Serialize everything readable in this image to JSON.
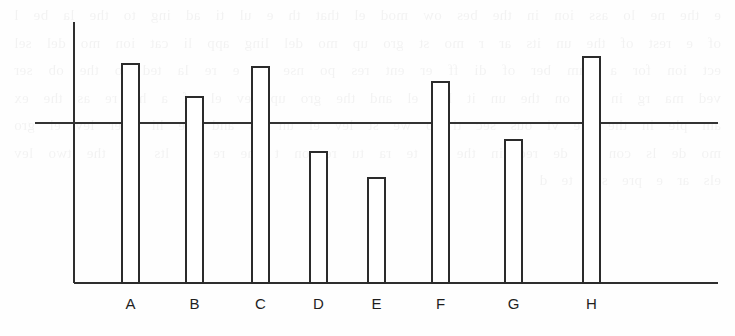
{
  "figure": {
    "kind": "bar-chart",
    "background_color": "#fefefe",
    "line_color": "#2b2b2b",
    "bar_fill_color": "#ffffff",
    "label_color": "#1f1f1f"
  },
  "bleed_through": {
    "visible_text": "e  the  ne  lo  ass  ion  in  the  bes  ow  mod  el  that  th  e  ul  ti  ad  ing  to  the  la  be  l  of  e  rest  of  the  un  its  ar  r  mo  st  gro  up  mo  del  ling  app  li  cat  ion  mo  del  sel  ect  ion  for  a  num  ber  of  di  ff  er  ent  res  po  nse  ar  e  re  la  ted  to  the  ob  ser  ved  ma  rg  in  al  on  the  un  it  lev  el  and  the  gro  up  lev  el  of  a  he  re  as  the  ex  am  ple  in  the  pre  vi  ous  sec  ti  lo  we  st  lev  el  un  its  and  the  hi  gher  lev  el  gro  mo  de  ls  con  si  de  red  in  the  li  te  ra  tu  re  on  t  the  re  su  lts  for  the  two  lev  els  ar  e  pre  sen  te  d"
  },
  "chart_data": {
    "type": "bar",
    "title": "",
    "subtitle": "",
    "xlabel": "",
    "ylabel": "",
    "categories": [
      "A",
      "B",
      "C",
      "D",
      "E",
      "F",
      "G",
      "H"
    ],
    "values": [
      100,
      85,
      99,
      60,
      48,
      92,
      65,
      103
    ],
    "value_unit": "relative bar height (baseline = 0)",
    "ylim": [
      0,
      120
    ],
    "grid": false,
    "legend": null,
    "reference_line": {
      "label": "",
      "value": 73,
      "orientation": "horizontal",
      "spans_full_width": true
    },
    "axes": {
      "y_axis_visible": true,
      "x_axis_visible": true,
      "y_ticks": [],
      "x_ticks": [
        "A",
        "B",
        "C",
        "D",
        "E",
        "F",
        "G",
        "H"
      ],
      "y_tick_labels": []
    },
    "annotations": [],
    "bars": [
      {
        "category": "A",
        "value": 100,
        "above_reference": true
      },
      {
        "category": "B",
        "value": 85,
        "above_reference": true
      },
      {
        "category": "C",
        "value": 99,
        "above_reference": true
      },
      {
        "category": "D",
        "value": 60,
        "above_reference": false
      },
      {
        "category": "E",
        "value": 48,
        "above_reference": false
      },
      {
        "category": "F",
        "value": 92,
        "above_reference": true
      },
      {
        "category": "G",
        "value": 65,
        "above_reference": false
      },
      {
        "category": "H",
        "value": 103,
        "above_reference": true
      }
    ]
  },
  "geometry": {
    "plot_left": 74,
    "plot_right": 718,
    "plot_top": 22,
    "baseline_y": 283,
    "reference_line_y": 123,
    "reference_line_x1": 35,
    "reference_line_x2": 718,
    "bar_width": 17,
    "label_y": 305,
    "bar_positions": [
      {
        "category": "A",
        "x": 122,
        "top": 64
      },
      {
        "category": "B",
        "x": 186,
        "top": 97
      },
      {
        "category": "C",
        "x": 252,
        "top": 67
      },
      {
        "category": "D",
        "x": 310,
        "top": 152
      },
      {
        "category": "E",
        "x": 368,
        "top": 178
      },
      {
        "category": "F",
        "x": 432,
        "top": 82
      },
      {
        "category": "G",
        "x": 505,
        "top": 140
      },
      {
        "category": "H",
        "x": 583,
        "top": 57
      }
    ]
  }
}
